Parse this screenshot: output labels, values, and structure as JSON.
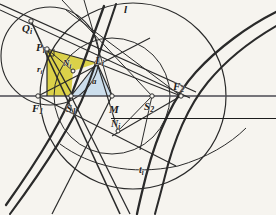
{
  "figure": {
    "type": "geometry-diagram",
    "width": 276,
    "height": 215,
    "background_color": "#f6f4ef",
    "ink_color": "#2a2a2a"
  },
  "shading": {
    "yellow_region_color": "#d9cf3f",
    "yellow_region_name": "triangle-Pi-Li-S1",
    "blue_region_color": "#c9dceb",
    "blue_region_name": "triangle-S1-Li-M"
  },
  "labels": [
    {
      "id": "Qi",
      "text": "Q",
      "sub": "i",
      "x": 22,
      "y": 23,
      "size": 11,
      "bar": false
    },
    {
      "id": "Pi",
      "text": "P",
      "sub": "i",
      "x": 36,
      "y": 42,
      "size": 11,
      "bar": false
    },
    {
      "id": "ri",
      "text": "r",
      "sub": "i",
      "x": 37,
      "y": 65,
      "size": 9,
      "bar": false
    },
    {
      "id": "Ni",
      "text": "N",
      "sub": "i",
      "x": 63,
      "y": 59,
      "size": 9,
      "bar": false
    },
    {
      "id": "Li",
      "text": "L",
      "sub": "i",
      "x": 95,
      "y": 55,
      "size": 11,
      "bar": false
    },
    {
      "id": "l",
      "text": "l",
      "sub": "",
      "x": 124,
      "y": 4,
      "size": 11,
      "bar": false
    },
    {
      "id": "a",
      "text": "a",
      "sub": "",
      "x": 92,
      "y": 77,
      "size": 9,
      "bar": false
    },
    {
      "id": "F1",
      "text": "F",
      "sub": "1",
      "x": 32,
      "y": 103,
      "size": 11,
      "bar": false
    },
    {
      "id": "S1",
      "text": "S",
      "sub": "1",
      "x": 66,
      "y": 103,
      "size": 11,
      "bar": false
    },
    {
      "id": "M",
      "text": "M",
      "sub": "",
      "x": 109,
      "y": 104,
      "size": 11,
      "bar": false
    },
    {
      "id": "S2",
      "text": "S",
      "sub": "2",
      "x": 144,
      "y": 101,
      "size": 11,
      "bar": false
    },
    {
      "id": "F2",
      "text": "F",
      "sub": "2",
      "x": 173,
      "y": 81,
      "size": 11,
      "bar": false
    },
    {
      "id": "Nbari",
      "text": "N",
      "sub": "i",
      "x": 111,
      "y": 119,
      "size": 10,
      "bar": true
    },
    {
      "id": "ti",
      "text": "t",
      "sub": "i",
      "x": 139,
      "y": 165,
      "size": 10,
      "bar": false
    }
  ],
  "points": [
    {
      "id": "Qi",
      "x": 31,
      "y": 21
    },
    {
      "id": "Pi",
      "x": 47,
      "y": 49
    },
    {
      "id": "Ni",
      "x": 73,
      "y": 71
    },
    {
      "id": "Li",
      "x": 97,
      "y": 63
    },
    {
      "id": "F1",
      "x": 38,
      "y": 96
    },
    {
      "id": "S1",
      "x": 71,
      "y": 96
    },
    {
      "id": "M",
      "x": 112,
      "y": 96
    },
    {
      "id": "S2",
      "x": 152,
      "y": 96
    },
    {
      "id": "F2",
      "x": 181,
      "y": 96
    },
    {
      "id": "Nbari",
      "x": 118,
      "y": 131
    }
  ],
  "circles": [
    {
      "id": "circle-left",
      "cx": 50,
      "cy": 56,
      "r": 49
    },
    {
      "id": "circle-large",
      "cx": 133,
      "cy": 96,
      "r": 93
    },
    {
      "id": "circle-mid",
      "cx": 112,
      "cy": 96,
      "r": 58
    }
  ],
  "axis": {
    "id": "principal-axis",
    "y": 96,
    "x1": 0,
    "x2": 276
  }
}
